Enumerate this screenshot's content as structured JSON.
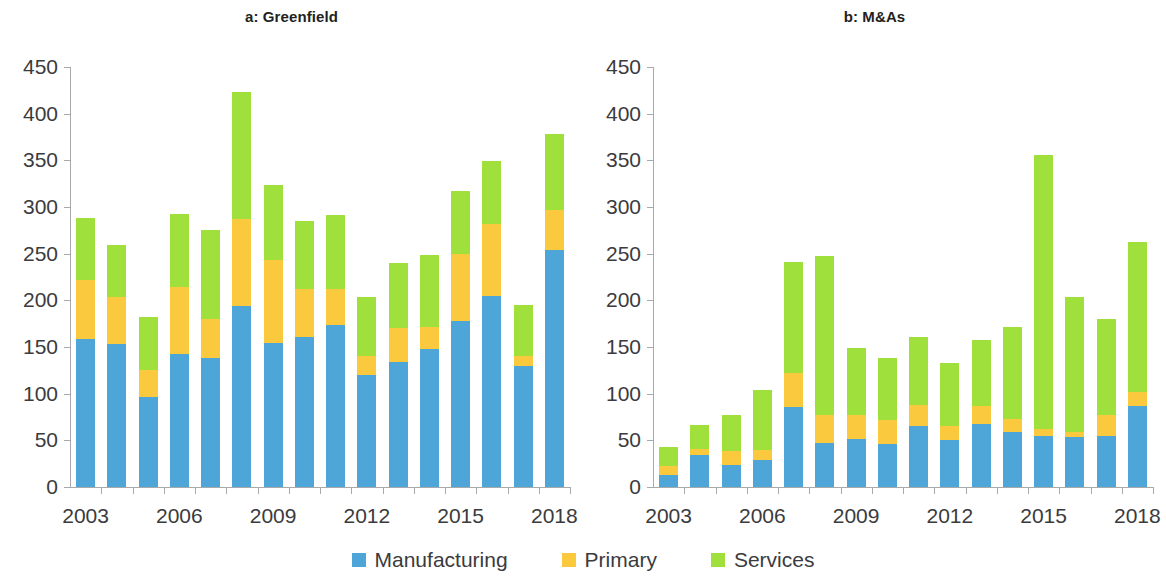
{
  "legend": {
    "items": [
      {
        "label": "Manufacturing",
        "color": "#4ea6d8",
        "key": "manufacturing"
      },
      {
        "label": "Primary",
        "color": "#fbc93d",
        "key": "primary"
      },
      {
        "label": "Services",
        "color": "#9fe03c",
        "key": "services"
      }
    ]
  },
  "colors": {
    "manufacturing": "#4ea6d8",
    "primary": "#fbc93d",
    "services": "#9fe03c",
    "axis": "#a7a9ac",
    "text": "#3b3b3d",
    "title": "#231f20",
    "background": "#ffffff"
  },
  "chart_data": [
    {
      "type": "bar",
      "title": "a: Greenfield",
      "panel": "a",
      "stacked": true,
      "xlabel": "",
      "ylabel": "",
      "ylim": [
        0,
        450
      ],
      "yticks": [
        0,
        50,
        100,
        150,
        200,
        250,
        300,
        350,
        400,
        450
      ],
      "ytick_labels": [
        "0",
        "50",
        "100",
        "150",
        "200",
        "250",
        "300",
        "350",
        "400",
        "450"
      ],
      "grid": false,
      "legend_position": "bottom",
      "categories": [
        2003,
        2004,
        2005,
        2006,
        2007,
        2008,
        2009,
        2010,
        2011,
        2012,
        2013,
        2014,
        2015,
        2016,
        2017,
        2018
      ],
      "xtick_labels": [
        "2003",
        "2006",
        "2009",
        "2012",
        "2015",
        "2018"
      ],
      "xtick_categories": [
        2003,
        2006,
        2009,
        2012,
        2015,
        2018
      ],
      "series": [
        {
          "name": "Manufacturing",
          "color": "#4ea6d8",
          "values": [
            159,
            153,
            96,
            143,
            138,
            194,
            154,
            161,
            174,
            120,
            134,
            148,
            178,
            205,
            130,
            254
          ]
        },
        {
          "name": "Primary",
          "color": "#fbc93d",
          "values": [
            63,
            51,
            29,
            71,
            42,
            93,
            89,
            51,
            38,
            20,
            36,
            23,
            72,
            77,
            10,
            43
          ]
        },
        {
          "name": "Services",
          "color": "#9fe03c",
          "values": [
            66,
            55,
            57,
            79,
            95,
            136,
            81,
            73,
            80,
            64,
            70,
            78,
            67,
            67,
            55,
            81
          ]
        }
      ],
      "totals": [
        288,
        259,
        182,
        293,
        275,
        423,
        324,
        285,
        292,
        204,
        240,
        249,
        317,
        349,
        195,
        378
      ]
    },
    {
      "type": "bar",
      "title": "b: M&As",
      "panel": "b",
      "stacked": true,
      "xlabel": "",
      "ylabel": "",
      "ylim": [
        0,
        450
      ],
      "yticks": [
        0,
        50,
        100,
        150,
        200,
        250,
        300,
        350,
        400,
        450
      ],
      "ytick_labels": [
        "0",
        "50",
        "100",
        "150",
        "200",
        "250",
        "300",
        "350",
        "400",
        "450"
      ],
      "grid": false,
      "legend_position": "bottom",
      "categories": [
        2003,
        2004,
        2005,
        2006,
        2007,
        2008,
        2009,
        2010,
        2011,
        2012,
        2013,
        2014,
        2015,
        2016,
        2017,
        2018
      ],
      "xtick_labels": [
        "2003",
        "2006",
        "2009",
        "2012",
        "2015",
        "2018"
      ],
      "xtick_categories": [
        2003,
        2006,
        2009,
        2012,
        2015,
        2018
      ],
      "series": [
        {
          "name": "Manufacturing",
          "color": "#4ea6d8",
          "values": [
            13,
            34,
            24,
            29,
            86,
            47,
            51,
            46,
            65,
            50,
            67,
            59,
            55,
            54,
            55,
            87
          ]
        },
        {
          "name": "Primary",
          "color": "#fbc93d",
          "values": [
            9,
            7,
            15,
            11,
            36,
            30,
            26,
            26,
            23,
            15,
            20,
            14,
            7,
            5,
            22,
            15
          ]
        },
        {
          "name": "Services",
          "color": "#9fe03c",
          "values": [
            21,
            25,
            38,
            64,
            119,
            170,
            72,
            66,
            73,
            68,
            71,
            98,
            294,
            145,
            103,
            160
          ]
        }
      ],
      "totals": [
        43,
        66,
        77,
        104,
        241,
        247,
        149,
        138,
        161,
        133,
        158,
        171,
        356,
        204,
        180,
        262
      ]
    }
  ]
}
